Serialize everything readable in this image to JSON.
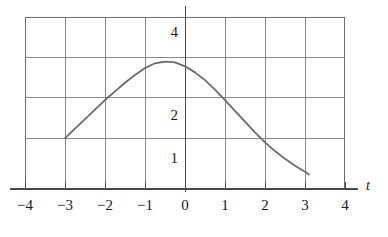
{
  "chart_data": {
    "type": "line",
    "title": "",
    "xlabel": "t",
    "ylabel": "",
    "xlim": [
      -4,
      4
    ],
    "ylim": [
      0,
      4
    ],
    "grid": true,
    "legend": null,
    "x_ticks": [
      -4,
      -3,
      -2,
      -1,
      0,
      1,
      2,
      3,
      4
    ],
    "x_tick_labels": [
      "−4",
      "−3",
      "−2",
      "−1",
      "0",
      "1",
      "2",
      "3",
      "4"
    ],
    "y_ticks": [
      1,
      2,
      3,
      4
    ],
    "y_tick_labels_visible": [
      {
        "value": 4,
        "label": "4"
      },
      {
        "value": 2,
        "label": "2"
      },
      {
        "value": 1,
        "label": "1"
      }
    ],
    "series": [
      {
        "name": "curve",
        "color": "#6b6b6b",
        "x": [
          -3.0,
          -2.75,
          -2.5,
          -2.25,
          -2.0,
          -1.75,
          -1.5,
          -1.25,
          -1.0,
          -0.75,
          -0.5,
          -0.25,
          0.0,
          0.25,
          0.5,
          0.75,
          1.0,
          1.25,
          1.5,
          1.75,
          2.0,
          2.25,
          2.5,
          2.75,
          3.0,
          3.1
        ],
        "y": [
          1.2,
          1.42,
          1.64,
          1.86,
          2.08,
          2.28,
          2.48,
          2.66,
          2.82,
          2.93,
          2.97,
          2.95,
          2.86,
          2.72,
          2.54,
          2.32,
          2.08,
          1.83,
          1.58,
          1.33,
          1.1,
          0.9,
          0.72,
          0.56,
          0.42,
          0.36
        ]
      }
    ]
  },
  "axis": {
    "x_label": "t"
  }
}
